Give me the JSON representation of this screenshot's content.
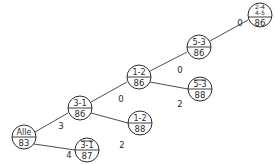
{
  "diagram": {
    "type": "tree",
    "nodes": [
      {
        "id": "n0",
        "top": "Alle",
        "bottom": "83",
        "x": 24,
        "y": 137
      },
      {
        "id": "n1",
        "top": "3-1",
        "bottom": "86",
        "x": 80,
        "y": 108
      },
      {
        "id": "n2",
        "top": "3-1",
        "bottom": "87",
        "x": 87,
        "y": 150
      },
      {
        "id": "n3",
        "top": "1-2",
        "bottom": "88",
        "x": 140,
        "y": 123
      },
      {
        "id": "n4",
        "top": "1-2",
        "bottom": "86",
        "x": 139,
        "y": 77
      },
      {
        "id": "n5",
        "top": "5-3",
        "bottom": "88",
        "x": 200,
        "y": 89
      },
      {
        "id": "n6",
        "top": "5-3",
        "bottom": "86",
        "x": 199,
        "y": 47
      },
      {
        "id": "n7",
        "top": "2-4",
        "top2": "4-5",
        "bottom": "86",
        "x": 260,
        "y": 15
      }
    ],
    "edges": [
      {
        "from": "n0",
        "to": "n1",
        "label": "3"
      },
      {
        "from": "n0",
        "to": "n2",
        "label": "4"
      },
      {
        "from": "n1",
        "to": "n4",
        "label": "0"
      },
      {
        "from": "n1",
        "to": "n3",
        "label": "2"
      },
      {
        "from": "n4",
        "to": "n6",
        "label": "0"
      },
      {
        "from": "n4",
        "to": "n5",
        "label": "2"
      },
      {
        "from": "n6",
        "to": "n7",
        "label": "0"
      }
    ]
  }
}
